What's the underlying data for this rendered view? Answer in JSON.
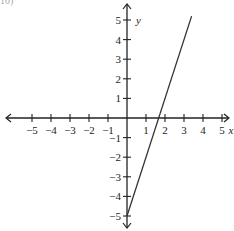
{
  "corner_label": "10)",
  "chart_data": {
    "type": "line",
    "title": "",
    "xlabel": "x",
    "ylabel": "y",
    "xlim": [
      -5,
      5
    ],
    "ylim": [
      -5,
      5
    ],
    "grid": false,
    "x_ticks": [
      -5,
      -4,
      -3,
      -2,
      -1,
      1,
      2,
      3,
      4,
      5
    ],
    "y_ticks": [
      -5,
      -4,
      -3,
      -2,
      -1,
      1,
      2,
      3,
      4,
      5
    ],
    "series": [
      {
        "name": "y = 3x - 5",
        "equation": "y = 3x - 5",
        "x": [
          0,
          3.4
        ],
        "y": [
          -5,
          5.2
        ]
      }
    ],
    "line_color": "#333333",
    "axis_color": "#222222"
  }
}
